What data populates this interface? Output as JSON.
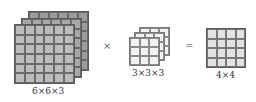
{
  "input_tensor": {
    "label": "6×6×3",
    "rows": 6,
    "cols": 6,
    "depth": 3
  },
  "kernel": {
    "label": "3×3×3",
    "rows": 3,
    "cols": 3,
    "depth": 3
  },
  "output": {
    "label": "4×4",
    "rows": 4,
    "cols": 4
  },
  "operators": {
    "multiply": "×",
    "equals": "="
  },
  "colors": {
    "input": "#b9b9b9",
    "kernel": "#f2f2f2",
    "output": "#e2e2e2",
    "grid_line": "#5a5a5a"
  }
}
